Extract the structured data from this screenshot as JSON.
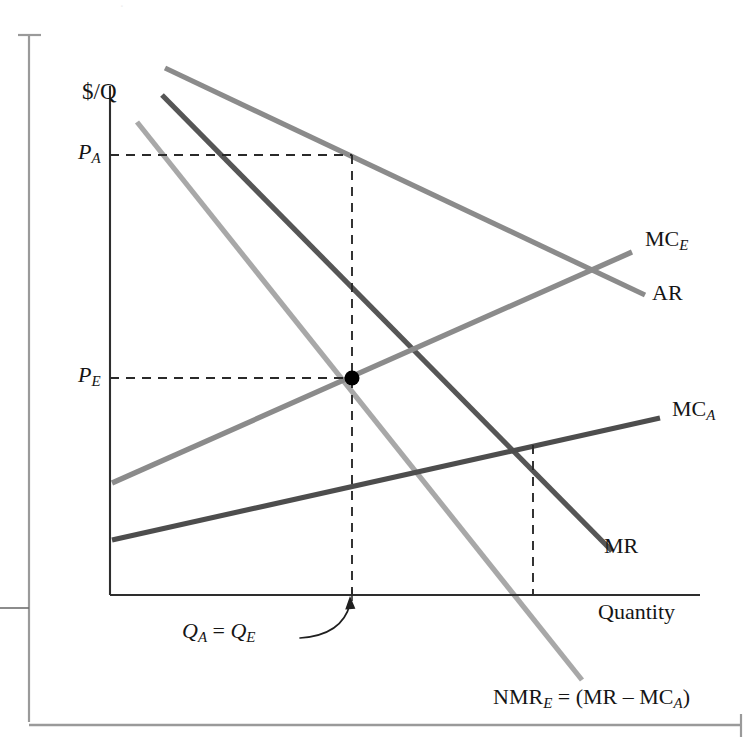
{
  "figure": {
    "axes": {
      "y_axis_label": "$/Q",
      "x_axis_label": "Quantity"
    },
    "price_ticks": [
      {
        "id": "PA",
        "base": "P",
        "sub": "A",
        "value_y": 155
      },
      {
        "id": "PE",
        "base": "P",
        "sub": "E",
        "value_y": 378
      }
    ],
    "quantity_annotation": {
      "text_left": "Q",
      "sub_left": "A",
      "equals": " = ",
      "text_right": "Q",
      "sub_right": "E",
      "full": "Q_A = Q_E"
    },
    "curve_labels": [
      {
        "id": "MCE",
        "base": "MC",
        "sub": "E",
        "full": "MC_E"
      },
      {
        "id": "AR",
        "base": "AR",
        "sub": "",
        "full": "AR"
      },
      {
        "id": "MCA",
        "base": "MC",
        "sub": "A",
        "full": "MC_A"
      },
      {
        "id": "MR",
        "base": "MR",
        "sub": "",
        "full": "MR"
      }
    ],
    "nmr_label": {
      "base": "NMR",
      "sub": "E",
      "rest": " = (MR ",
      "minus": "–",
      "rest2": " MC",
      "sub2": "A",
      "close": ")",
      "full": "NMR_E = (MR - MC_A)"
    },
    "colors": {
      "background": "#ffffff",
      "axis": "#2e2e2e",
      "ar_curve": "#8b8b8b",
      "mce_curve": "#8b8b8b",
      "mr_curve": "#565656",
      "mca_curve": "#4d4d4d",
      "nmre_curve": "#a8a8a8",
      "dashed": "#2a2a2a",
      "dot": "#000000",
      "page_rule": "#8f8f8f"
    }
  },
  "chart_data": {
    "type": "line",
    "title": "",
    "xlabel": "Quantity",
    "ylabel": "$/Q",
    "grid": false,
    "legend": "inline-end-labels",
    "axis_origin_px": [
      110,
      595
    ],
    "xlim_px": [
      110,
      700
    ],
    "ylim_px": [
      595,
      70
    ],
    "series": [
      {
        "name": "AR",
        "label": "AR",
        "color": "#8b8b8b",
        "points_px": [
          [
            165,
            68
          ],
          [
            645,
            295
          ]
        ],
        "description": "average revenue, downward sloping demand curve"
      },
      {
        "name": "MR",
        "label": "MR",
        "color": "#565656",
        "points_px": [
          [
            162,
            95
          ],
          [
            612,
            551
          ]
        ],
        "description": "marginal revenue, steeper than AR"
      },
      {
        "name": "NMR_E",
        "label": "NMR_E = (MR - MC_A)",
        "color": "#a8a8a8",
        "points_px": [
          [
            137,
            122
          ],
          [
            582,
            680
          ]
        ],
        "description": "net marginal revenue, MR minus MC_A, steepest downward line"
      },
      {
        "name": "MC_E",
        "label": "MC_E",
        "color": "#8b8b8b",
        "points_px": [
          [
            112,
            483
          ],
          [
            632,
            252
          ]
        ],
        "description": "marginal cost of E, upward sloping"
      },
      {
        "name": "MC_A",
        "label": "MC_A",
        "color": "#4d4d4d",
        "points_px": [
          [
            112,
            540
          ],
          [
            660,
            418
          ]
        ],
        "description": "marginal cost of A, upward sloping, flatter"
      }
    ],
    "markers": [
      {
        "name": "equilibrium-point",
        "x_px": 352,
        "y_px": 378,
        "label": "intersection of NMR_E and MC_E at Q_A = Q_E and P_E"
      }
    ],
    "guide_lines": [
      {
        "name": "PA-horizontal",
        "from_px": [
          110,
          155
        ],
        "to_px": [
          352,
          155
        ],
        "style": "dashed"
      },
      {
        "name": "PE-horizontal",
        "from_px": [
          110,
          378
        ],
        "to_px": [
          352,
          378
        ],
        "style": "dashed"
      },
      {
        "name": "QA-vertical",
        "from_px": [
          352,
          155
        ],
        "to_px": [
          352,
          595
        ],
        "style": "dashed"
      },
      {
        "name": "QM-vertical",
        "from_px": [
          533,
          445
        ],
        "to_px": [
          533,
          595
        ],
        "style": "dashed"
      }
    ],
    "annotations": [
      {
        "text": "Q_A = Q_E",
        "at_px": [
          220,
          630
        ],
        "arrow_to_px": [
          350,
          598
        ]
      }
    ]
  }
}
